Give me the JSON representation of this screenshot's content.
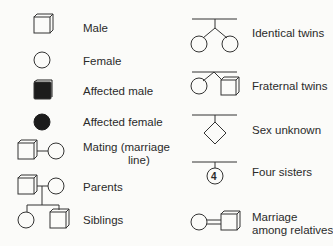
{
  "colors": {
    "background": "#fbfbf9",
    "stroke": "#333333",
    "fill_affected": "#1c1c1c",
    "text": "#2a2a2a"
  },
  "left_column": [
    {
      "symbol": "square-icon",
      "label": "Male"
    },
    {
      "symbol": "circle-icon",
      "label": "Female"
    },
    {
      "symbol": "filled-square-icon",
      "label": "Affected male"
    },
    {
      "symbol": "filled-circle-icon",
      "label": "Affected female"
    },
    {
      "symbol": "mating-line-icon",
      "label_line1": "Mating (marriage",
      "label_line2": "line)"
    },
    {
      "symbol": "parents-icon",
      "label": "Parents"
    },
    {
      "symbol": "siblings-icon",
      "label": "Siblings"
    }
  ],
  "right_column": [
    {
      "symbol": "identical-twins-icon",
      "label": "Identical twins"
    },
    {
      "symbol": "fraternal-twins-icon",
      "label": "Fraternal twins"
    },
    {
      "symbol": "diamond-icon",
      "label": "Sex unknown"
    },
    {
      "symbol": "numbered-circle-icon",
      "number": "4",
      "label": "Four sisters"
    },
    {
      "symbol": "consanguineous-marriage-icon",
      "label_line1": "Marriage",
      "label_line2": "among relatives"
    }
  ]
}
